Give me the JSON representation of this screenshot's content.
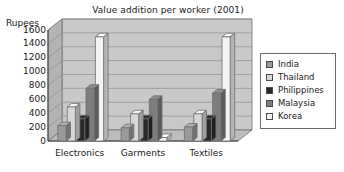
{
  "chart_data": {
    "type": "bar",
    "title": "Value addition per worker (2001)",
    "xlabel": "",
    "ylabel": "Rupees",
    "categories": [
      "Electronics",
      "Garments",
      "Textiles"
    ],
    "series": [
      {
        "name": "India",
        "color": "#9a9a9a",
        "values": [
          220,
          190,
          200
        ]
      },
      {
        "name": "Thailand",
        "color": "#d8d8d8",
        "values": [
          490,
          390,
          390
        ]
      },
      {
        "name": "Philippines",
        "color": "#2a2a2a",
        "values": [
          320,
          320,
          320
        ]
      },
      {
        "name": "Malaysia",
        "color": "#7d7d7d",
        "values": [
          760,
          600,
          690
        ]
      },
      {
        "name": "Korea",
        "color": "#f4f4f2",
        "values": [
          1500,
          50,
          1500
        ]
      }
    ],
    "ylim": [
      0,
      1600
    ],
    "yticks": [
      0,
      200,
      400,
      600,
      800,
      1000,
      1200,
      1400,
      1600
    ],
    "ytick_labels": [
      "0",
      "200",
      "400",
      "600",
      "800",
      "1000",
      "1200",
      "1400",
      "1600"
    ],
    "grid": true,
    "legend_position": "right",
    "plot_background": "#c9c9c9",
    "three_d": true
  }
}
